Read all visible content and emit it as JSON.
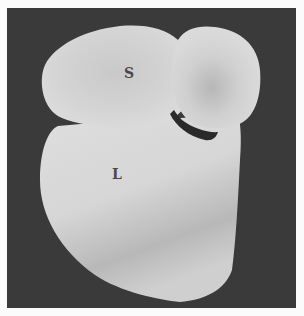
{
  "photo": {
    "background_color": "#3a3a3a",
    "specimen_color": "#d4d4d4",
    "crescent_color": "#2a2a2a"
  },
  "labels": {
    "s": "S",
    "l": "L"
  }
}
